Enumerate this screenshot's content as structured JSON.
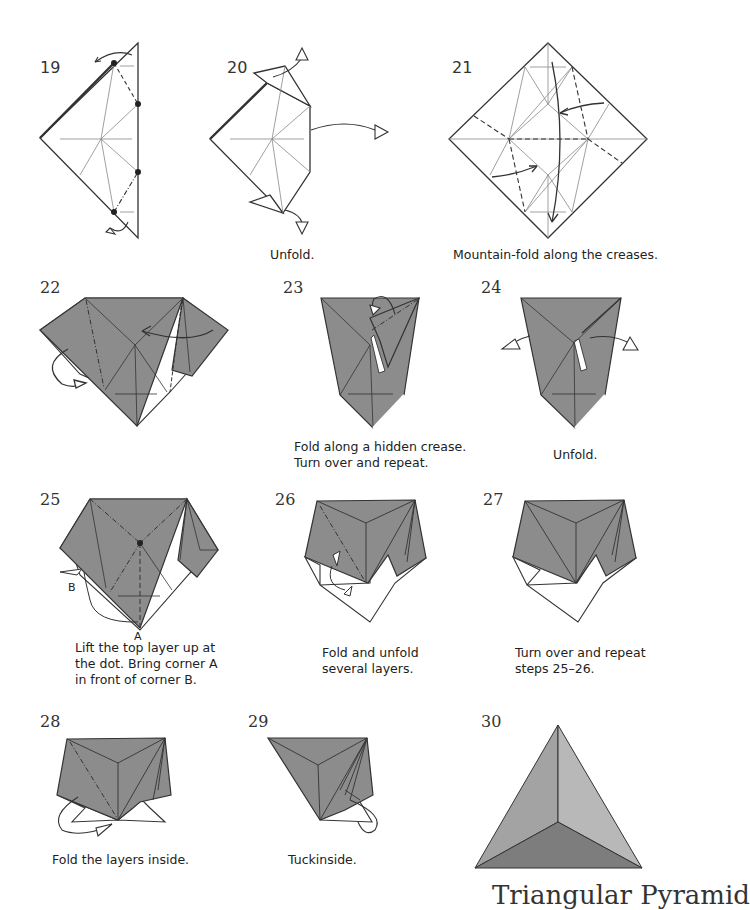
{
  "page": {
    "type": "origami instruction diagram",
    "paper_colors": {
      "front": "#8c8c8c",
      "back": "#ffffff",
      "line": "#333333",
      "crease": "#777777",
      "final_light": "#b5b5b5",
      "final_mid": "#a3a3a3",
      "final_dark": "#7d7d7d"
    }
  },
  "steps": [
    {
      "number": "19",
      "caption": ""
    },
    {
      "number": "20",
      "caption": "Unfold."
    },
    {
      "number": "21",
      "caption": "Mountain-fold along the creases."
    },
    {
      "number": "22",
      "caption": ""
    },
    {
      "number": "23",
      "caption_line1": "Fold along a hidden crease.",
      "caption_line2": "Turn over and repeat."
    },
    {
      "number": "24",
      "caption": "Unfold."
    },
    {
      "number": "25",
      "caption_line1": "Lift the top layer up at",
      "caption_line2": "the dot. Bring corner A",
      "caption_line3": "in front of corner B.",
      "label_a": "A",
      "label_b": "B"
    },
    {
      "number": "26",
      "caption_line1": "Fold and unfold",
      "caption_line2": "several layers."
    },
    {
      "number": "27",
      "caption_line1": "Turn over and repeat",
      "caption_line2": "steps 25–26."
    },
    {
      "number": "28",
      "caption": "Fold the layers inside."
    },
    {
      "number": "29",
      "caption": "Tuckinside."
    },
    {
      "number": "30",
      "caption": ""
    }
  ],
  "final_title": "Triangular Pyramid"
}
